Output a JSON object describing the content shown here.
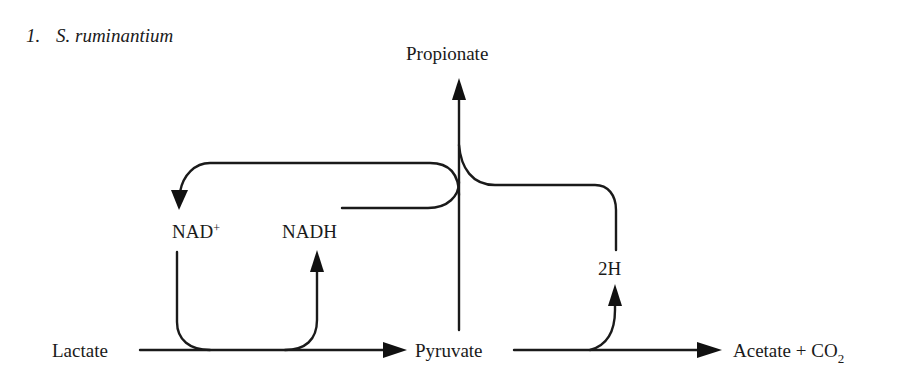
{
  "title": {
    "number": "1.",
    "organism": "S. ruminantium"
  },
  "nodes": {
    "lactate": "Lactate",
    "pyruvate": "Pyruvate",
    "propionate": "Propionate",
    "acetate": "Acetate + CO",
    "acetate_subscript": "2",
    "nad_plus": "NAD",
    "nad_plus_superscript": "+",
    "nadh": "NADH",
    "two_h": "2H"
  },
  "edges": [
    {
      "from": "Lactate",
      "to": "Pyruvate",
      "type": "arrow"
    },
    {
      "from": "Pyruvate",
      "to": "Acetate + CO2",
      "type": "arrow"
    },
    {
      "from": "Pyruvate",
      "to": "Propionate",
      "type": "arrow"
    },
    {
      "from": "NAD+",
      "to": "NADH",
      "type": "coupled-cofactor",
      "via": "Lactate → Pyruvate"
    },
    {
      "from": "Pyruvate→Acetate",
      "to": "2H",
      "type": "arrow"
    },
    {
      "from": "NADH",
      "to": "Propionate pathway",
      "type": "curved-line"
    },
    {
      "from": "2H",
      "to": "NAD+",
      "type": "curved-arrow",
      "via": "Propionate pathway"
    }
  ],
  "colors": {
    "ink": "#1a1a1a",
    "background": "#ffffff"
  }
}
